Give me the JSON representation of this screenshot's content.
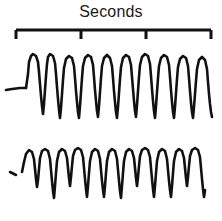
{
  "figure": {
    "title": "Seconds",
    "background_color": "#ffffff",
    "ink_color": "#111111",
    "width": 222,
    "height": 221
  },
  "scale_bar": {
    "name": "seconds-scale-bar",
    "label": "Seconds",
    "units": "seconds",
    "tick_count": 4,
    "interval_count": 3,
    "tick_positions_px": [
      16,
      81,
      146,
      211
    ],
    "tick_labels": [
      "",
      "",
      "",
      ""
    ],
    "x_start_px": 16,
    "x_end_px": 211,
    "baseline_y_px": 6,
    "tick_length_px": 9,
    "stroke_width_px": 3
  },
  "chart_data": {
    "type": "line",
    "title": "Seconds",
    "xlabel": "Seconds",
    "ylabel": "",
    "grid": false,
    "legend": "none",
    "xlim": [
      0,
      222
    ],
    "series": [
      {
        "name": "trace-upper",
        "label": "Upper recording trace",
        "stroke": "#111111",
        "stroke_width": 2.6,
        "lead_in": "M 6 46 L 12 45 L 20 44 L 26 44",
        "path": "M 26 44 L 28 30 L 29 18 L 31 12 L 33 10 L 36 12 L 38 18 L 39 28 L 40 40 L 41 52 L 42 62 L 43 70 L 44 60 L 45 46 L 46 32 L 47 20 L 48 13 L 50 10 L 53 12 L 55 19 L 56 30 L 57 43 L 58 55 L 59 66 L 60 74 L 61 64 L 62 50 L 63 36 L 64 24 L 66 15 L 69 12 L 72 14 L 74 22 L 75 34 L 76 47 L 77 58 L 78 68 L 79 74 L 80 62 L 81 48 L 82 34 L 83 22 L 85 14 L 88 11 L 91 13 L 93 21 L 94 33 L 95 46 L 96 57 L 97 67 L 98 73 L 99 62 L 100 48 L 101 34 L 102 22 L 104 14 L 107 11 L 110 14 L 112 22 L 113 34 L 114 47 L 115 58 L 116 68 L 117 74 L 118 63 L 119 49 L 120 35 L 121 23 L 123 14 L 126 11 L 129 13 L 131 21 L 132 33 L 133 45 L 134 57 L 135 67 L 136 73 L 137 61 L 138 47 L 139 33 L 140 21 L 142 13 L 145 10 L 148 12 L 150 20 L 151 32 L 152 45 L 153 57 L 154 67 L 155 74 L 156 62 L 157 48 L 158 34 L 159 22 L 161 14 L 164 11 L 167 13 L 169 21 L 170 33 L 171 46 L 172 58 L 173 68 L 174 74 L 175 63 L 176 49 L 177 35 L 178 23 L 180 15 L 183 12 L 186 14 L 188 22 L 189 34 L 190 47 L 191 59 L 192 68 L 193 74 L 194 63 L 195 50 L 196 37 L 197 25 L 199 16 L 202 13 L 205 16 L 207 25 L 208 38 L 209 50 L 210 60 L 211 68 L 212 73"
      },
      {
        "name": "trace-lower",
        "label": "Lower recording trace",
        "stroke": "#111111",
        "stroke_width": 2.6,
        "lead_in": "M 10 44 L 16 47",
        "path": "M 22 44 L 24 34 L 26 26 L 29 22 L 32 24 L 34 31 L 35 41 L 36 51 L 37 59 L 38 52 L 39 41 L 40 30 L 42 23 L 45 21 L 48 23 L 50 31 L 51 42 L 52 53 L 53 63 L 54 70 L 55 58 L 56 45 L 57 33 L 59 24 L 62 21 L 65 23 L 67 30 L 68 40 L 69 50 L 70 58 L 71 49 L 72 38 L 73 28 L 75 22 L 78 20 L 81 22 L 83 29 L 84 40 L 85 51 L 86 61 L 87 69 L 88 58 L 89 45 L 90 33 L 92 24 L 95 21 L 98 23 L 100 31 L 101 42 L 102 53 L 103 62 L 104 69 L 105 58 L 106 45 L 107 33 L 109 24 L 112 21 L 115 23 L 117 31 L 118 42 L 119 53 L 120 63 L 121 70 L 122 58 L 123 45 L 124 33 L 126 24 L 129 21 L 132 23 L 134 30 L 135 40 L 136 50 L 137 58 L 138 49 L 139 38 L 140 28 L 142 22 L 145 20 L 148 22 L 150 29 L 151 40 L 152 51 L 153 61 L 154 69 L 155 58 L 156 45 L 157 33 L 159 24 L 162 21 L 165 23 L 167 31 L 168 42 L 169 53 L 170 62 L 171 69 L 172 58 L 173 45 L 174 33 L 176 24 L 179 21 L 182 23 L 184 30 L 185 40 L 186 50 L 187 58 L 188 49 L 189 38 L 190 28 L 192 22 L 195 20 L 198 22 L 200 29 L 201 40 L 202 51 L 203 61 L 204 69 L 205 62"
      }
    ]
  }
}
